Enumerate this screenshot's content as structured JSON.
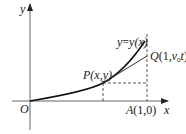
{
  "diagram": {
    "axes": {
      "x_label": "x",
      "y_label": "y",
      "origin_label": "O"
    },
    "curve": {
      "label_y": "y",
      "label_eq": "=",
      "label_fn": "y(x)"
    },
    "points": {
      "P": {
        "name": "P",
        "coords": "(x,y)"
      },
      "Q": {
        "name": "Q",
        "coords_open": "(1,",
        "v": "v",
        "sub": "0",
        "t": "t",
        "coords_close": ")"
      },
      "A": {
        "name": "A",
        "coords": "(1,0)"
      }
    },
    "colors": {
      "axis": "#555555",
      "curve": "#111111",
      "tangent": "#333333",
      "dashed": "#444444"
    }
  }
}
